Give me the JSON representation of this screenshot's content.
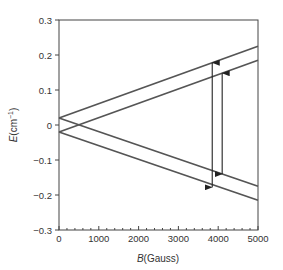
{
  "chart_data": {
    "type": "line",
    "title": "",
    "xlabel": "B(Gauss)",
    "xlabel_italic_part": "B",
    "xlabel_rest": "(Gauss)",
    "ylabel": "E(cm⁻¹)",
    "ylabel_italic_part": "E",
    "ylabel_rest": "(cm",
    "ylabel_sup": "−1",
    "ylabel_close": ")",
    "xlim": [
      0,
      5000
    ],
    "ylim": [
      -0.3,
      0.3
    ],
    "xticks": [
      0,
      1000,
      2000,
      3000,
      4000,
      5000
    ],
    "xtick_labels": [
      "0",
      "1000",
      "2000",
      "3000",
      "4000",
      "5000"
    ],
    "x_minor_step": 200,
    "yticks": [
      0.3,
      0.2,
      0.1,
      0,
      -0.1,
      -0.2,
      -0.3
    ],
    "ytick_labels": [
      "0.3",
      "0.2",
      "0.1",
      "0",
      "−0.1",
      "−0.2",
      "−0.3"
    ],
    "grid": false,
    "legend": null,
    "line_color": "#555555",
    "series": [
      {
        "name": "level-1",
        "x": [
          0,
          5000
        ],
        "values": [
          0.02,
          0.225
        ]
      },
      {
        "name": "level-2",
        "x": [
          0,
          5000
        ],
        "values": [
          -0.02,
          0.185
        ]
      },
      {
        "name": "level-3",
        "x": [
          0,
          5000
        ],
        "values": [
          0.02,
          -0.175
        ]
      },
      {
        "name": "level-4",
        "x": [
          0,
          5000
        ],
        "values": [
          -0.02,
          -0.215
        ]
      }
    ],
    "annotations": [
      {
        "type": "double-arrow",
        "x": 3850,
        "y_from": -0.178,
        "y_to": 0.178,
        "from_series": "level-4",
        "to_series": "level-1"
      },
      {
        "type": "double-arrow",
        "x": 4100,
        "y_from": -0.14,
        "y_to": 0.148,
        "from_series": "level-3",
        "to_series": "level-2"
      }
    ]
  }
}
